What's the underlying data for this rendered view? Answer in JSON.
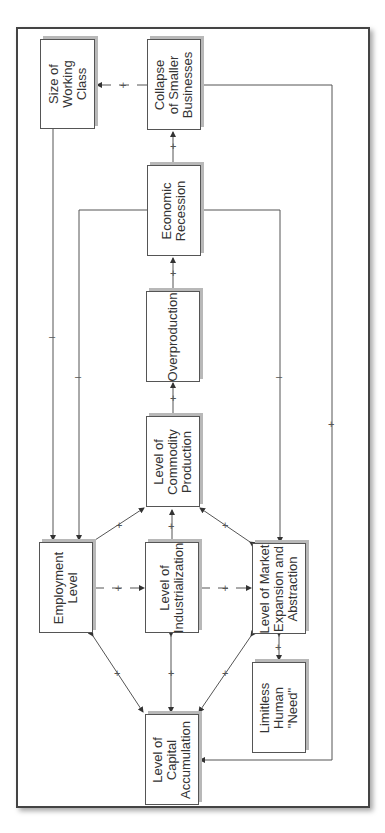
{
  "diagram": {
    "type": "causal-loop",
    "orientation": "rotated-90-ccw",
    "nodes": [
      {
        "id": "working_class",
        "label": "Size of\nWorking\nClass"
      },
      {
        "id": "collapse",
        "label": "Collapse\nof Smaller\nBusinesses"
      },
      {
        "id": "recession",
        "label": "Economic\nRecession"
      },
      {
        "id": "overproduction",
        "label": "Overproduction"
      },
      {
        "id": "commodity",
        "label": "Level of\nCommodity\nProduction"
      },
      {
        "id": "employment",
        "label": "Employment\nLevel"
      },
      {
        "id": "industrialization",
        "label": "Level of\nIndustrialization"
      },
      {
        "id": "market",
        "label": "Level of Market\nExpansion and\nAbstraction"
      },
      {
        "id": "need",
        "label": "Limitless\nHuman\n\"Need\""
      },
      {
        "id": "capital",
        "label": "Level of\nCapital\nAccumulation"
      }
    ],
    "edges": [
      {
        "from": "collapse",
        "to": "working_class",
        "sign": "+"
      },
      {
        "from": "recession",
        "to": "collapse",
        "sign": "+"
      },
      {
        "from": "overproduction",
        "to": "recession",
        "sign": "+"
      },
      {
        "from": "commodity",
        "to": "overproduction",
        "sign": "+"
      },
      {
        "from": "working_class",
        "to": "employment",
        "sign": "–"
      },
      {
        "from": "recession",
        "to": "employment",
        "sign": "–"
      },
      {
        "from": "recession",
        "to": "market",
        "sign": "–"
      },
      {
        "from": "collapse",
        "to": "capital",
        "sign": "+"
      },
      {
        "from": "employment",
        "to": "commodity",
        "sign": "+",
        "bidirectional": true
      },
      {
        "from": "industrialization",
        "to": "commodity",
        "sign": "+"
      },
      {
        "from": "market",
        "to": "commodity",
        "sign": "+",
        "bidirectional": true
      },
      {
        "from": "employment",
        "to": "industrialization",
        "sign": "+",
        "bidirectional": true
      },
      {
        "from": "industrialization",
        "to": "market",
        "sign": "+",
        "bidirectional": true
      },
      {
        "from": "market",
        "to": "need",
        "sign": "+",
        "bidirectional": true
      },
      {
        "from": "capital",
        "to": "employment",
        "sign": "+",
        "bidirectional": true
      },
      {
        "from": "capital",
        "to": "industrialization",
        "sign": "+",
        "bidirectional": true
      },
      {
        "from": "capital",
        "to": "market",
        "sign": "+",
        "bidirectional": true
      }
    ],
    "labels": {
      "plus": "+",
      "minus": "–"
    }
  }
}
